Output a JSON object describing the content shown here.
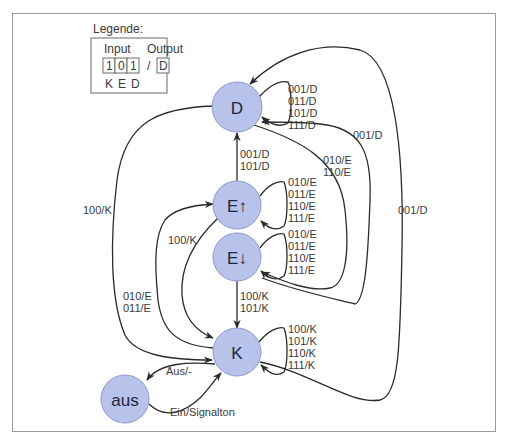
{
  "legend": {
    "title": "Legende:",
    "input_label": "Input",
    "output_label": "Output",
    "input_bits": [
      "1",
      "0",
      "1"
    ],
    "separator": "/",
    "output_value": "D",
    "bit_names": [
      "K",
      "E",
      "D"
    ]
  },
  "nodes": {
    "D": "D",
    "Eup": "E↑",
    "Edown": "E↓",
    "K": "K",
    "aus": "aus"
  },
  "edges": {
    "D_self": [
      "001/D",
      "011/D",
      "101/D",
      "111/D"
    ],
    "Eup_to_D": [
      "001/D",
      "101/D"
    ],
    "Edown_to_D": [
      "001/D"
    ],
    "D_to_Edown": [
      "010/E",
      "110/E"
    ],
    "K_to_D": [
      "001/D"
    ],
    "D_to_K": [
      "100/K"
    ],
    "Eup_self": [
      "010/E",
      "011/E",
      "110/E",
      "111/E"
    ],
    "Eup_to_K": [
      "100/K"
    ],
    "K_to_Eup": [
      "010/E",
      "011/E"
    ],
    "Edown_self": [
      "010/E",
      "011/E",
      "110/E",
      "111/E"
    ],
    "Edown_to_K": [
      "100/K",
      "101/K"
    ],
    "K_self": [
      "100/K",
      "101/K",
      "110/K",
      "111/K"
    ],
    "K_to_aus": [
      "Aus/-"
    ],
    "aus_to_K": [
      "Ein/Signalton"
    ]
  },
  "colors": {
    "node_fill": "#b7c3ea",
    "node_stroke": "#8e9bc8",
    "edge": "#2b2b2b"
  }
}
